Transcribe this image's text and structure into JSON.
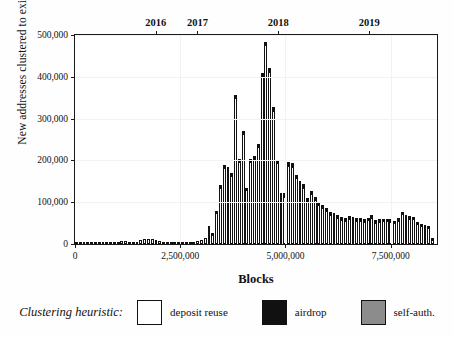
{
  "chart_data": {
    "type": "bar",
    "title": "",
    "xlabel": "Blocks",
    "ylabel": "New addresses clustered to existing entity",
    "xlim": [
      0,
      8600000
    ],
    "ylim": [
      0,
      500000
    ],
    "grid": true,
    "legend_position": "bottom",
    "y_ticks": [
      0,
      100000,
      200000,
      300000,
      400000,
      500000
    ],
    "y_tick_labels": [
      "0",
      "100,000",
      "200,000",
      "300,000",
      "400,000",
      "500,000"
    ],
    "x_ticks": [
      0,
      2500000,
      5000000,
      7500000
    ],
    "x_tick_labels": [
      "0",
      "2,500,000",
      "5,000,000",
      "7,500,000"
    ],
    "secondary_axis": {
      "position": "top",
      "ticks": [
        1920000,
        2910000,
        4830000,
        6990000
      ],
      "tick_labels": [
        "2016",
        "2017",
        "2018",
        "2019"
      ]
    },
    "bin_width": 90000,
    "series": [
      {
        "name": "deposit reuse",
        "color": "#ffffff",
        "values": [
          500,
          600,
          700,
          800,
          900,
          1000,
          1100,
          1200,
          1400,
          1600,
          4000,
          5000,
          6500,
          7000,
          5500,
          5000,
          6000,
          9000,
          12000,
          13000,
          11000,
          9000,
          7000,
          6000,
          5000,
          4500,
          4000,
          4000,
          4500,
          5000,
          5500,
          6000,
          7000,
          9000,
          14000,
          41000,
          26000,
          78000,
          139000,
          186000,
          182000,
          166000,
          351000,
          200000,
          265000,
          131000,
          198000,
          206000,
          234000,
          402000,
          478000,
          414000,
          322000,
          196000,
          117000,
          116000,
          190000,
          188000,
          160000,
          144000,
          137000,
          104000,
          122000,
          107000,
          96000,
          88000,
          83000,
          72000,
          70000,
          66000,
          60000,
          58000,
          63000,
          62000,
          58000,
          59000,
          57000,
          60000,
          66000,
          54000,
          56000,
          58000,
          58000,
          57000,
          53000,
          59000,
          74000,
          66000,
          64000,
          62000,
          51000,
          46000,
          44000,
          42000,
          14000
        ]
      },
      {
        "name": "airdrop",
        "color": "#111111",
        "values": [
          0,
          0,
          0,
          0,
          0,
          0,
          0,
          0,
          0,
          0,
          0,
          0,
          0,
          0,
          0,
          0,
          0,
          0,
          0,
          0,
          0,
          0,
          0,
          0,
          0,
          0,
          0,
          0,
          0,
          0,
          0,
          0,
          0,
          0,
          0,
          1000,
          1000,
          1500,
          2000,
          3000,
          3000,
          3000,
          5000,
          4000,
          6000,
          4000,
          5000,
          5000,
          5000,
          7000,
          6000,
          6000,
          6000,
          6000,
          5000,
          5000,
          7000,
          7000,
          6000,
          6000,
          6000,
          5000,
          6000,
          5000,
          5000,
          5000,
          4000,
          4000,
          4000,
          4000,
          3500,
          3500,
          3500,
          3500,
          3500,
          3500,
          3000,
          3000,
          3500,
          3000,
          3000,
          3000,
          3000,
          3000,
          3000,
          3000,
          3500,
          3500,
          3000,
          3000,
          2500,
          2500,
          2500,
          2000,
          1000
        ]
      },
      {
        "name": "self-auth.",
        "color": "#8c8c8c",
        "values": [
          0,
          0,
          0,
          0,
          0,
          0,
          0,
          0,
          0,
          0,
          0,
          0,
          0,
          0,
          0,
          0,
          0,
          0,
          0,
          0,
          0,
          0,
          0,
          0,
          0,
          0,
          0,
          0,
          0,
          0,
          0,
          0,
          0,
          0,
          0,
          0,
          0,
          0,
          0,
          0,
          0,
          0,
          0,
          0,
          0,
          0,
          0,
          0,
          0,
          0,
          0,
          0,
          0,
          0,
          0,
          0,
          0,
          0,
          0,
          0,
          0,
          0,
          0,
          0,
          0,
          0,
          0,
          0,
          0,
          0,
          0,
          0,
          0,
          0,
          0,
          0,
          0,
          0,
          0,
          0,
          0,
          0,
          0,
          0,
          0,
          0,
          0,
          0,
          0,
          0,
          0,
          0,
          0,
          0,
          0
        ]
      }
    ]
  },
  "legend": {
    "title": "Clustering heuristic:",
    "items": [
      {
        "label": "deposit reuse",
        "color": "#ffffff"
      },
      {
        "label": "airdrop",
        "color": "#111111"
      },
      {
        "label": "self-auth.",
        "color": "#8c8c8c"
      }
    ]
  }
}
